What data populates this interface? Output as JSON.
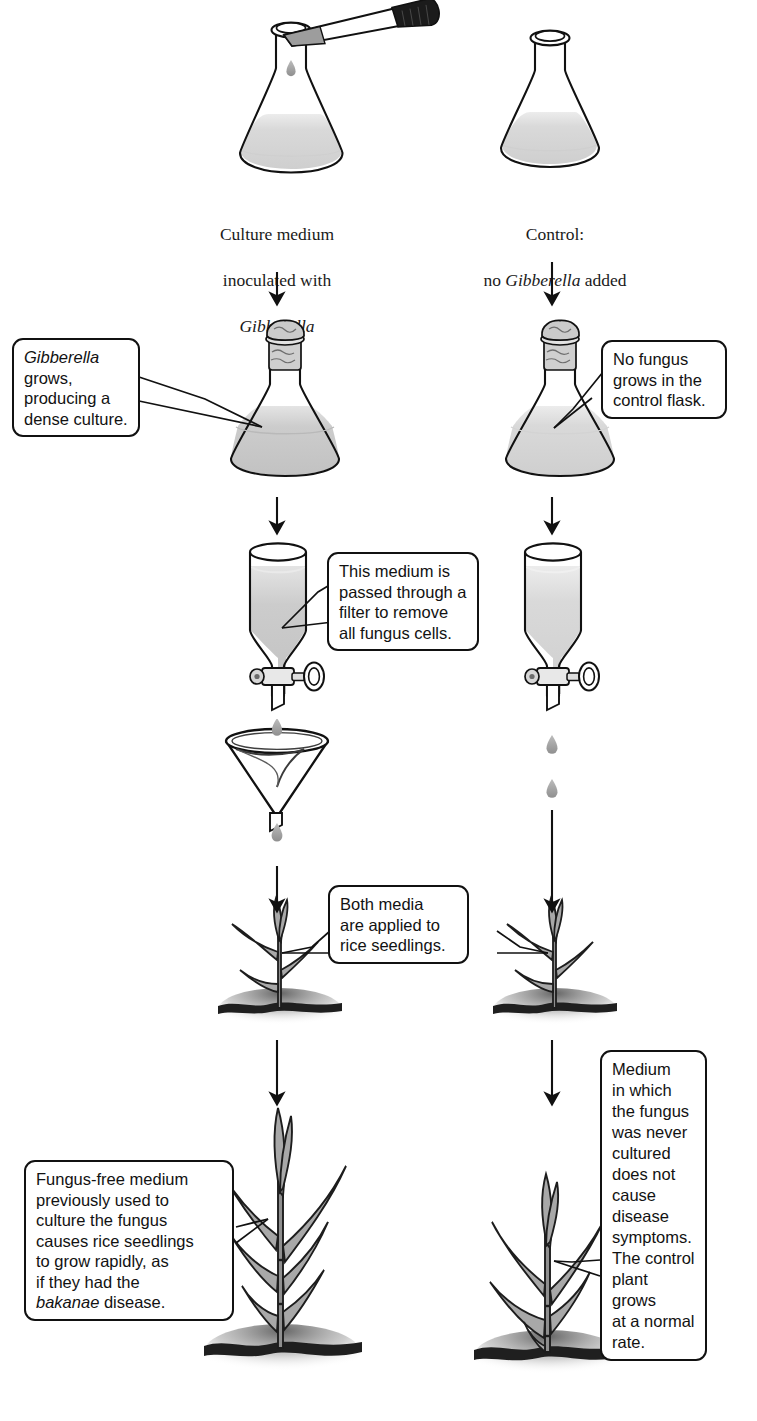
{
  "figure": {
    "kind": "experiment-flowchart",
    "columns": [
      {
        "id": "experimental",
        "label": "Culture medium\ninoculated with Gibberella"
      },
      {
        "id": "control",
        "label": "Control:\nno Gibberella added"
      }
    ]
  },
  "top_labels": {
    "left": {
      "line1": "Culture medium",
      "line2": "inoculated with",
      "line3": "Gibberella"
    },
    "right": {
      "line1": "Control:",
      "line2_prefix": "no ",
      "line2_italic": "Gibberella",
      "line2_suffix": " added"
    }
  },
  "callouts": {
    "fungus_grows": {
      "italic_lead": "Gibberella",
      "rest": " grows,\nproducing a\ndense culture."
    },
    "no_fungus": {
      "text": "No fungus\ngrows in the\ncontrol flask."
    },
    "filter": {
      "text": "This medium is\npassed through a\nfilter to remove\nall fungus cells."
    },
    "both_media": {
      "text": "Both media\nare applied to\nrice seedlings."
    },
    "fungus_free_result": {
      "part1": "Fungus-free medium\npreviously used to\nculture the fungus\ncauses rice seedlings\nto grow rapidly, as\nif they had the\n",
      "italic": "bakanae",
      "part2": " disease."
    },
    "control_result": {
      "text": "Medium\nin which\nthe fungus\nwas never\ncultured\ndoes not\ncause\ndisease\nsymptoms.\nThe control\nplant grows\nat a normal\nrate."
    }
  },
  "stages": [
    {
      "step": 1,
      "name": "inoculation",
      "left_apparatus": "erlenmeyer-flask-with-dropper",
      "right_apparatus": "erlenmeyer-flask"
    },
    {
      "step": 2,
      "name": "incubation",
      "left_apparatus": "stoppered-flask-dense-culture",
      "right_apparatus": "stoppered-flask-clear-medium"
    },
    {
      "step": 3,
      "name": "filtration",
      "left_apparatus": "separatory-funnel-and-filter-funnel",
      "right_apparatus": "separatory-funnel"
    },
    {
      "step": 4,
      "name": "application",
      "left_apparatus": "rice-seedling-small",
      "right_apparatus": "rice-seedling-small"
    },
    {
      "step": 5,
      "name": "result",
      "left_apparatus": "rice-seedling-tall",
      "right_apparatus": "rice-seedling-normal"
    }
  ],
  "icons": {
    "dropper": "dropper-icon",
    "flask": "erlenmeyer-flask-icon",
    "stopper": "cotton-stopper-icon",
    "droplet": "liquid-droplet-icon",
    "separatory_funnel": "separatory-funnel-icon",
    "stopcock": "stopcock-valve-icon",
    "filter_funnel": "filter-funnel-icon",
    "seedling": "rice-seedling-icon",
    "soil": "soil-line-icon",
    "arrow_down": "arrow-down-icon"
  },
  "colors": {
    "ink": "#111111",
    "text": "#121212",
    "medium_fill": "#d8d8d8",
    "culture_fill": "#c9c9c9",
    "leaf_fill": "#a8a8a8",
    "soil": "#2b2b2b",
    "dropper_bulb": "#1b1b1b",
    "background": "#ffffff"
  },
  "counts": {
    "arrows": 10,
    "callouts": 6,
    "flasks": 4,
    "funnels": 3,
    "plants": 4
  }
}
